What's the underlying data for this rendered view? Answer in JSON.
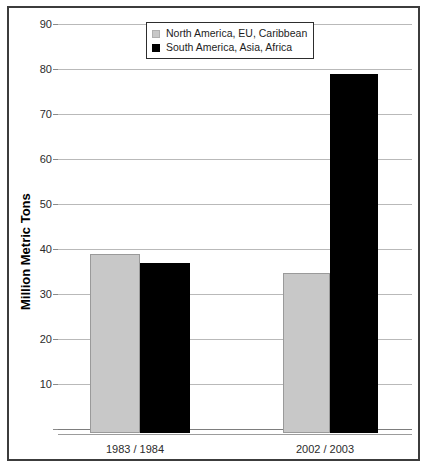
{
  "chart_data": {
    "type": "bar",
    "title": "",
    "subtitle": "",
    "xlabel": "",
    "ylabel": "Million Metric Tons",
    "categories": [
      "1983 / 1984",
      "2002 / 2003"
    ],
    "series": [
      {
        "name": "North America, EU, Caribbean",
        "color": "#c8c8c8",
        "values": [
          39.8,
          35.5
        ]
      },
      {
        "name": "South America, Asia, Africa",
        "color": "#000000",
        "values": [
          37.8,
          79.8
        ]
      }
    ],
    "ylim": [
      0,
      90
    ],
    "y_ticks": [
      90,
      80,
      70,
      60,
      50,
      40,
      30,
      20,
      10
    ],
    "y_tick_labels": [
      "90",
      "80",
      "70",
      "60",
      "50",
      "40",
      "30",
      "20",
      "10"
    ],
    "grid": true,
    "legend_position": "top-center"
  },
  "legend": {
    "items": [
      {
        "label": "North America, EU, Caribbean",
        "swatch": "gray-square-icon"
      },
      {
        "label": "South America, Asia, Africa",
        "swatch": "black-square-icon"
      }
    ]
  },
  "axes": {
    "y_title": "Million Metric Tons"
  }
}
